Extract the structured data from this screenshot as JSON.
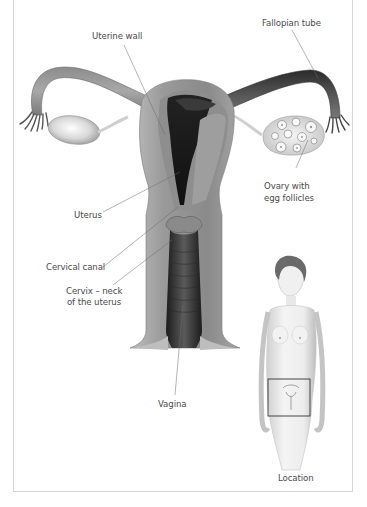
{
  "diagram": {
    "type": "anatomical-illustration",
    "labels": {
      "fallopian_tube": "Fallopian tube",
      "uterine_wall": "Uterine wall",
      "ovary_line1": "Ovary with",
      "ovary_line2": "egg follicles",
      "uterus": "Uterus",
      "cervical_canal": "Cervical canal",
      "cervix_line1": "Cervix – neck",
      "cervix_line2": "of the uterus",
      "vagina": "Vagina",
      "location": "Location"
    },
    "colors": {
      "background": "#ffffff",
      "frame_border": "#d4d4d4",
      "label_text": "#4a4a4a",
      "leader_line": "#6a6a6a",
      "tissue_mid": "#9a9a9a",
      "tissue_dark": "#1a1a1a"
    },
    "inset": {
      "caption": "Location",
      "highlight_box": "pelvic region"
    }
  }
}
